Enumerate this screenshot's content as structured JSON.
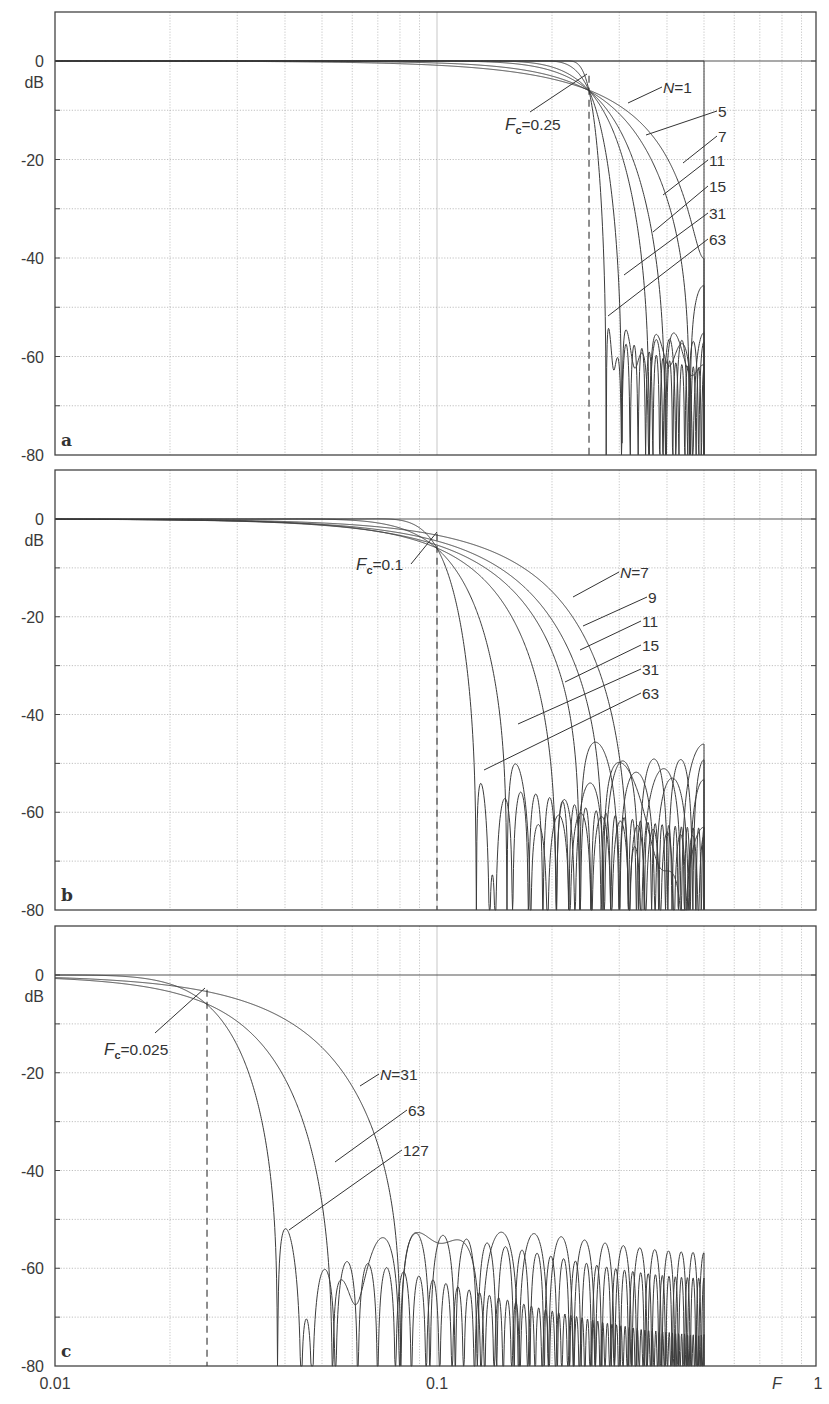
{
  "chart_data": [
    {
      "type": "line",
      "panel": "a",
      "title": "",
      "xlabel": "F",
      "ylabel": "dB",
      "xscale": "log",
      "xlim": [
        0.01,
        1
      ],
      "ylim": [
        -80,
        10
      ],
      "yticks": [
        0,
        -20,
        -40,
        -60,
        -80
      ],
      "cutoff": 0.25,
      "cutoff_label": "F_c = 0.25",
      "series": [
        {
          "name": "N=1",
          "N": 1
        },
        {
          "name": "N=5",
          "N": 5
        },
        {
          "name": "N=7",
          "N": 7
        },
        {
          "name": "N=11",
          "N": 11
        },
        {
          "name": "N=15",
          "N": 15
        },
        {
          "name": "N=31",
          "N": 31
        },
        {
          "name": "N=63",
          "N": 63
        }
      ],
      "annotations": [
        "N=1",
        "5",
        "7",
        "11",
        "15",
        "31",
        "63"
      ],
      "stopband_floor_db": -55
    },
    {
      "type": "line",
      "panel": "b",
      "xlabel": "F",
      "ylabel": "dB",
      "xscale": "log",
      "xlim": [
        0.01,
        1
      ],
      "ylim": [
        -80,
        10
      ],
      "yticks": [
        0,
        -20,
        -40,
        -60,
        -80
      ],
      "cutoff": 0.1,
      "cutoff_label": "F_c = 0.1",
      "series": [
        {
          "name": "N=7",
          "N": 7
        },
        {
          "name": "N=9",
          "N": 9
        },
        {
          "name": "N=11",
          "N": 11
        },
        {
          "name": "N=15",
          "N": 15
        },
        {
          "name": "N=31",
          "N": 31
        },
        {
          "name": "N=63",
          "N": 63
        }
      ],
      "annotations": [
        "N=7",
        "9",
        "11",
        "15",
        "31",
        "63"
      ],
      "stopband_floor_db": -52
    },
    {
      "type": "line",
      "panel": "c",
      "xlabel": "F",
      "ylabel": "dB",
      "xscale": "log",
      "xlim": [
        0.01,
        1
      ],
      "ylim": [
        -80,
        10
      ],
      "yticks": [
        0,
        -20,
        -40,
        -60,
        -80
      ],
      "xticks": [
        "0.01",
        "0.1",
        "1"
      ],
      "cutoff": 0.025,
      "cutoff_label": "F_c = 0.025",
      "series": [
        {
          "name": "N=31",
          "N": 31
        },
        {
          "name": "N=63",
          "N": 63
        },
        {
          "name": "N=127",
          "N": 127
        }
      ],
      "annotations": [
        "N=31",
        "63",
        "127"
      ],
      "stopband_floor_db": -55
    }
  ],
  "axis": {
    "y_unit": "dB",
    "x_name": "F",
    "x_tick_labels": [
      "0.01",
      "0.1",
      "1"
    ],
    "y_tick_labels": [
      "0",
      "-20",
      "-40",
      "-60",
      "-80"
    ]
  },
  "panels": [
    {
      "id": "a",
      "letter": "a",
      "fc_prefix": "F",
      "fc_sub": "c",
      "fc_value": "=0.25",
      "labels": [
        {
          "text": "N=1",
          "tx": 663,
          "ty": 93,
          "lx": 628,
          "ly": 103
        },
        {
          "text": "5",
          "tx": 718,
          "ty": 117,
          "lx": 646,
          "ly": 135
        },
        {
          "text": "7",
          "tx": 718,
          "ty": 142,
          "lx": 683,
          "ly": 163
        },
        {
          "text": "11",
          "tx": 709,
          "ty": 166,
          "lx": 663,
          "ly": 195
        },
        {
          "text": "15",
          "tx": 709,
          "ty": 192,
          "lx": 653,
          "ly": 232
        },
        {
          "text": "31",
          "tx": 709,
          "ty": 219,
          "lx": 624,
          "ly": 275
        },
        {
          "text": "63",
          "tx": 709,
          "ty": 245,
          "lx": 608,
          "ly": 316
        }
      ],
      "fc_label": {
        "tx": 505,
        "ty": 130,
        "lx": 530,
        "ly": 112,
        "px": 587,
        "py": 74
      }
    },
    {
      "id": "b",
      "letter": "b",
      "fc_prefix": "F",
      "fc_sub": "c",
      "fc_value": "=0.1",
      "labels": [
        {
          "text": "N=7",
          "tx": 620,
          "ty": 578,
          "lx": 573,
          "ly": 597
        },
        {
          "text": "9",
          "tx": 648,
          "ty": 603,
          "lx": 583,
          "ly": 626
        },
        {
          "text": "11",
          "tx": 642,
          "ty": 627,
          "lx": 580,
          "ly": 650
        },
        {
          "text": "15",
          "tx": 642,
          "ty": 651,
          "lx": 565,
          "ly": 682
        },
        {
          "text": "31",
          "tx": 642,
          "ty": 675,
          "lx": 518,
          "ly": 724
        },
        {
          "text": "63",
          "tx": 642,
          "ty": 699,
          "lx": 484,
          "ly": 770
        }
      ],
      "fc_label": {
        "tx": 356,
        "ty": 570,
        "lx": 411,
        "ly": 564,
        "px": 437,
        "py": 532
      }
    },
    {
      "id": "c",
      "letter": "c",
      "fc_prefix": "F",
      "fc_sub": "c",
      "fc_value": "=0.025",
      "labels": [
        {
          "text": "N=31",
          "tx": 380,
          "ty": 1080,
          "lx": 360,
          "ly": 1086
        },
        {
          "text": "63",
          "tx": 408,
          "ty": 1116,
          "lx": 335,
          "ly": 1162
        },
        {
          "text": "127",
          "tx": 403,
          "ty": 1156,
          "lx": 289,
          "ly": 1230
        }
      ],
      "fc_label": {
        "tx": 104,
        "ty": 1055,
        "lx": 155,
        "ly": 1033,
        "px": 205,
        "py": 988
      }
    }
  ]
}
